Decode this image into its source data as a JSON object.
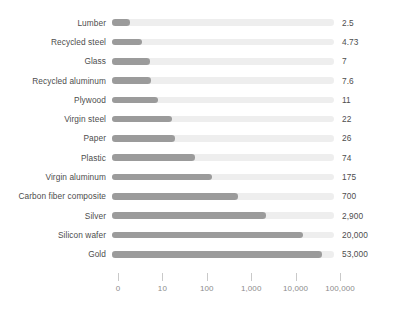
{
  "chart_data": {
    "type": "bar",
    "orientation": "horizontal",
    "scale": "log10",
    "title": "",
    "subtitle": "",
    "xlabel": "",
    "ylabel": "",
    "grid": false,
    "legend": null,
    "axis": {
      "tick_labels": [
        "0",
        "10",
        "100",
        "1,000",
        "10,000",
        "100,000"
      ],
      "tick_values": [
        1,
        10,
        100,
        1000,
        10000,
        100000
      ],
      "xlim": [
        1,
        100000
      ]
    },
    "categories": [
      "Lumber",
      "Recycled steel",
      "Glass",
      "Recycled aluminum",
      "Plywood",
      "Virgin steel",
      "Paper",
      "Plastic",
      "Virgin aluminum",
      "Carbon fiber composite",
      "Silver",
      "Silicon wafer",
      "Gold"
    ],
    "values": [
      2.5,
      4.73,
      7,
      7.6,
      11,
      22,
      26,
      74,
      175,
      700,
      2900,
      20000,
      53000
    ],
    "value_labels": [
      "2.5",
      "4.73",
      "7",
      "7.6",
      "11",
      "22",
      "26",
      "74",
      "175",
      "700",
      "2,900",
      "20,000",
      "53,000"
    ],
    "colors": {
      "bar_fill": "#9b9b9b",
      "bar_track": "#eeeeee",
      "label_text": "#4d4d4d",
      "axis_text": "#8c8c8c",
      "tick_mark": "#c9c9c9",
      "background": "#ffffff"
    }
  }
}
